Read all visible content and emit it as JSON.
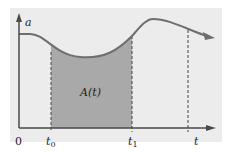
{
  "figure": {
    "type": "area-under-curve diagram",
    "y_axis_label": "a",
    "x_axis_label": "t",
    "origin_label": "0",
    "marker_labels": {
      "t0": "t",
      "t0_sub": "0",
      "t1": "t",
      "t1_sub": "1",
      "t_end": "t"
    },
    "region_label": "A(t)",
    "colors": {
      "panel_background": "#ececec",
      "shaded_region": "#a9a9a9",
      "curve": "#6e6e6e",
      "axes": "#4a4a4a",
      "dashed_lines": "#444444",
      "text": "#222222"
    }
  }
}
